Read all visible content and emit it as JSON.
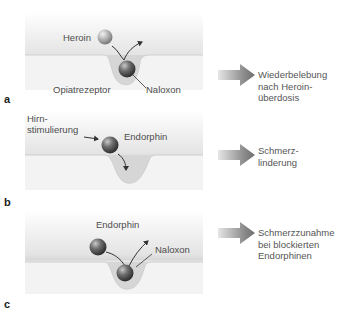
{
  "panels": [
    {
      "letter": "a",
      "labels": {
        "heroin": "Heroin",
        "receptor": "Opiatrezeptor",
        "naloxon": "Naloxon"
      },
      "result": "Wiederbelebung\nnach Heroin-\nüberdosis"
    },
    {
      "letter": "b",
      "labels": {
        "stimulation": "Hirn-\nstimulierung",
        "endorphin": "Endorphin"
      },
      "result": "Schmerz-\nlinderung"
    },
    {
      "letter": "c",
      "labels": {
        "endorphin": "Endorphin",
        "naloxon": "Naloxon"
      },
      "result": "Schmerzzunahme\nbei blockierten\nEndorphinen"
    }
  ],
  "colors": {
    "membrane_top": "#ececec",
    "membrane_bottom": "#f6f6f6",
    "pocket": "#d9d9d9",
    "sphere_dark": "#5a5a5a",
    "sphere_light": "#b9b9b9",
    "arrow": "#8a8a8a"
  }
}
